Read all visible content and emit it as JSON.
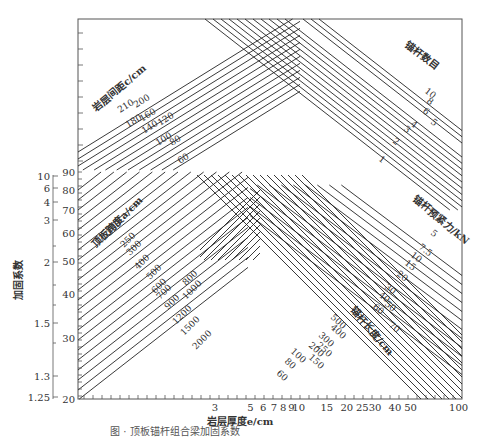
{
  "chart_data": {
    "type": "nomogram",
    "title": "",
    "caption": "图 · 顶板锚杆组合梁加固系数",
    "xlabel": "岩层厚度e/cm",
    "ylabel": "加固系数",
    "x_axis": {
      "scale": "log",
      "ticks": [
        "3",
        "5",
        "6",
        "7",
        "8",
        "9",
        "10",
        "15",
        "20",
        "25",
        "30",
        "40",
        "50",
        "100"
      ]
    },
    "y_axis_outer": {
      "label": "加固系数",
      "ticks": [
        "10",
        "6",
        "4",
        "3",
        "2",
        "1.5",
        "1.3",
        "1.25"
      ]
    },
    "y_axis_inner": {
      "ticks": [
        "90",
        "80",
        "70",
        "60",
        "50",
        "40",
        "30",
        "20"
      ]
    },
    "families": [
      {
        "name": "岩层间距c/cm",
        "direction": "up-right",
        "region": "upper-left",
        "values": [
          "210",
          "200",
          "180",
          "160",
          "140",
          "120",
          "100",
          "80",
          "60"
        ]
      },
      {
        "name": "锚杆数目",
        "direction": "down-right",
        "region": "upper-right",
        "values": [
          "10",
          "8",
          "6",
          "5",
          "4",
          "3",
          "2",
          "1"
        ]
      },
      {
        "name": "顶板跨度a/cm",
        "direction": "up-right",
        "region": "lower-left",
        "values": [
          "200",
          "250",
          "300",
          "400",
          "500",
          "600",
          "700",
          "800",
          "900",
          "1000",
          "1200",
          "1500",
          "2000"
        ]
      },
      {
        "name": "锚杆预紧力/kN",
        "direction": "down-right",
        "region": "lower-right",
        "values": [
          "5",
          "7.5",
          "10",
          "15",
          "20",
          "30",
          "40",
          "50",
          "60",
          "70"
        ]
      },
      {
        "name": "锚杆长度/cm",
        "direction": "down-right",
        "region": "lower-middle",
        "values": [
          "500",
          "400",
          "300",
          "250",
          "200",
          "150",
          "100",
          "80",
          "60"
        ]
      }
    ]
  }
}
